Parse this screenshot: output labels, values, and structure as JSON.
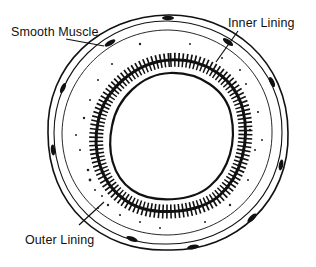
{
  "diagram": {
    "labels": [
      {
        "id": "smooth-muscle",
        "text": "Smooth Muscle"
      },
      {
        "id": "inner-lining",
        "text": "Inner Lining"
      },
      {
        "id": "outer-lining",
        "text": "Outer Lining"
      }
    ],
    "colors": {
      "ink": "#111111",
      "background": "#ffffff"
    }
  }
}
